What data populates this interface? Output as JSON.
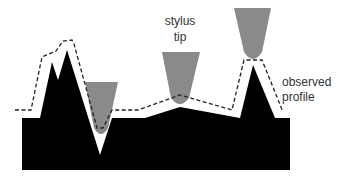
{
  "diagram": {
    "labels": {
      "stylus_line1": "stylus",
      "stylus_line2": "tip",
      "observed_line1": "observed",
      "observed_line2": "profile"
    },
    "colors": {
      "surface": "#000000",
      "stylus": "#8a8a8a",
      "profile_line": "#222222",
      "text": "#333333",
      "background": "#ffffff"
    },
    "elements": [
      {
        "id": "surface",
        "type": "sample-surface",
        "description": "black sample with two left peaks, a deep narrow V valley, a gentle hump and a sharp right peak"
      },
      {
        "id": "stylus-1",
        "type": "stylus-tip",
        "position": "stuck in V valley"
      },
      {
        "id": "stylus-2",
        "type": "stylus-tip",
        "position": "on gentle hump"
      },
      {
        "id": "stylus-3",
        "type": "stylus-tip",
        "position": "on sharp peak"
      },
      {
        "id": "observed-profile",
        "type": "dashed-line",
        "description": "traced stylus path, broadened relative to true surface"
      }
    ]
  }
}
